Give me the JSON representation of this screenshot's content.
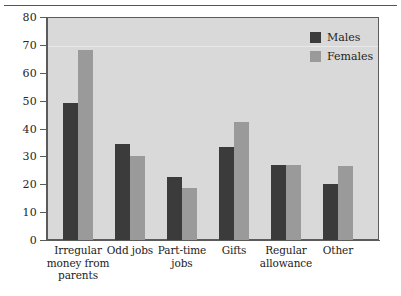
{
  "chart_data": {
    "type": "bar",
    "title": "",
    "subtitle": "",
    "xlabel": "",
    "ylabel": "",
    "ylim": [
      0,
      80
    ],
    "ytick_step": 10,
    "yticks": [
      "80",
      "70",
      "60",
      "50",
      "40",
      "30",
      "20",
      "10",
      "0"
    ],
    "grid": false,
    "legend_position": "top-right",
    "categories": [
      "Irregular money from parents",
      "Odd jobs",
      "Part-time jobs",
      "Gifts",
      "Regular allowance",
      "Other"
    ],
    "category_label_lines": [
      [
        "Irregular",
        "money from",
        "parents"
      ],
      [
        "Odd jobs"
      ],
      [
        "Part-time",
        "jobs"
      ],
      [
        "Gifts"
      ],
      [
        "Regular",
        "allowance"
      ],
      [
        "Other"
      ]
    ],
    "series": [
      {
        "name": "Males",
        "color": "#3b3b3b",
        "values": [
          49,
          34.5,
          22.5,
          33.5,
          27,
          20
        ]
      },
      {
        "name": "Females",
        "color": "#9a9a9a",
        "values": [
          68,
          30,
          18.5,
          42.5,
          27,
          26.5
        ]
      }
    ]
  },
  "legend": {
    "items": [
      {
        "label": "Males",
        "color": "#3b3b3b"
      },
      {
        "label": "Females",
        "color": "#9a9a9a"
      }
    ]
  },
  "colors": {
    "plot_background": "#d9d9d9",
    "axis": "#5b5b5b",
    "males": "#3b3b3b",
    "females": "#9a9a9a",
    "text": "#222222"
  }
}
